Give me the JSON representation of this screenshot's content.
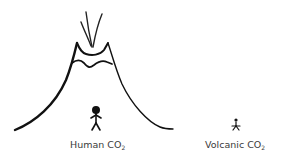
{
  "diagram": {
    "type": "illustration",
    "elements": {
      "volcano": {
        "icon": "volcano-icon",
        "stroke_color": "#111111"
      },
      "smoke": {
        "icon": "smoke-plume-icon"
      },
      "human_figure": {
        "icon": "stick-figure-icon",
        "size": "large"
      },
      "volcanic_figure": {
        "icon": "stick-figure-icon",
        "size": "small"
      }
    },
    "labels": {
      "human": {
        "text": "Human CO",
        "subscript": "2"
      },
      "volcanic": {
        "text": "Volcanic CO",
        "subscript": "2"
      }
    }
  }
}
